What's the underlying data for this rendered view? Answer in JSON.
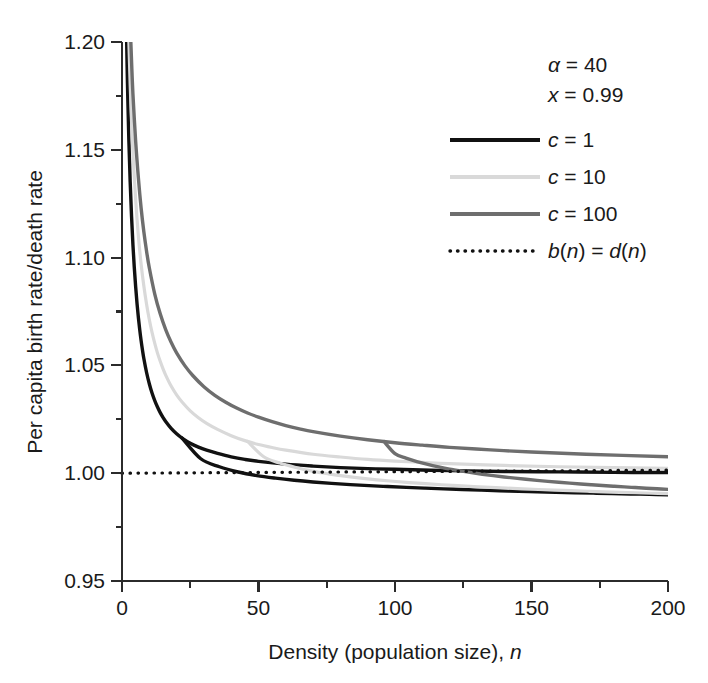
{
  "chart_data": {
    "type": "line",
    "title": "",
    "xlabel": "Density (population size), n",
    "ylabel": "Per capita birth rate/death rate",
    "xlim": [
      0,
      200
    ],
    "ylim": [
      0.95,
      1.2
    ],
    "grid": false,
    "legend_position": "top-right",
    "x_ticks": [
      0,
      50,
      100,
      150,
      200
    ],
    "x_tick_labels": [
      "0",
      "50",
      "100",
      "150",
      "200"
    ],
    "x_minor_ticks": [
      25,
      75,
      125,
      175
    ],
    "y_ticks": [
      0.95,
      1.0,
      1.05,
      1.1,
      1.15,
      1.2
    ],
    "y_tick_labels": [
      "0.95",
      "1.00",
      "1.05",
      "1.10",
      "1.15",
      "1.20"
    ],
    "y_minor_ticks": [
      0.975,
      1.025,
      1.075,
      1.125,
      1.175
    ],
    "annotations": [
      {
        "name": "alpha-param",
        "text": "α = 40"
      },
      {
        "name": "x-param",
        "text": "x = 0.99"
      }
    ],
    "series": [
      {
        "name": "c = 1",
        "label": "c = 1",
        "color": "#111111",
        "width": 3.4,
        "style": "solid",
        "x": [
          0.4,
          0.8,
          1.2,
          1.6,
          2,
          2.5,
          3,
          3.5,
          4,
          4.5,
          5,
          5.5,
          6,
          6.5,
          7,
          7.5,
          8,
          9,
          10,
          11,
          12,
          13,
          14,
          15,
          16,
          18,
          20,
          22,
          25,
          28,
          31,
          35,
          40,
          45,
          50,
          60,
          70,
          80,
          90,
          100,
          120,
          140,
          160,
          180,
          200
        ],
        "y": [
          1.36,
          1.29,
          1.242,
          1.208,
          1.181,
          1.155,
          1.135,
          1.119,
          1.106,
          1.0955,
          1.0865,
          1.0788,
          1.0722,
          1.0665,
          1.0615,
          1.0571,
          1.0532,
          1.0467,
          1.0415,
          1.0372,
          1.0337,
          1.0307,
          1.0281,
          1.0259,
          1.024,
          1.0208,
          1.0183,
          1.0163,
          1.0139,
          1.0121,
          1.0107,
          1.0092,
          1.0076,
          1.0064,
          1.0055,
          1.0042,
          1.0033,
          1.0026,
          1.0021,
          1.0018,
          1.0012,
          1.0008,
          1.0006,
          1.0004,
          1.0003
        ]
      },
      {
        "name": "c = 10",
        "label": "c = 10",
        "color": "#d9d9d9",
        "width": 3.2,
        "style": "solid",
        "x": [
          0.4,
          0.8,
          1.2,
          1.6,
          2,
          2.5,
          3,
          3.5,
          4,
          5,
          6,
          7,
          8,
          9,
          10,
          11,
          12,
          13,
          14,
          15,
          16,
          18,
          20,
          22,
          25,
          28,
          31,
          35,
          40,
          45,
          50,
          55,
          60,
          70,
          80,
          90,
          100,
          110,
          120,
          140,
          160,
          180,
          200
        ],
        "y": [
          1.4,
          1.335,
          1.289,
          1.255,
          1.228,
          1.201,
          1.18,
          1.163,
          1.149,
          1.127,
          1.11,
          1.097,
          1.0868,
          1.0784,
          1.0713,
          1.0653,
          1.0602,
          1.0557,
          1.0519,
          1.0485,
          1.0455,
          1.0404,
          1.0363,
          1.033,
          1.0289,
          1.0257,
          1.0231,
          1.0203,
          1.0174,
          1.0151,
          1.0133,
          1.0119,
          1.0107,
          1.0088,
          1.0075,
          1.0064,
          1.0056,
          1.005,
          1.0044,
          1.0036,
          1.003,
          1.0026,
          1.0023
        ]
      },
      {
        "name": "c = 100",
        "label": "c = 100",
        "color": "#6e6e6e",
        "width": 3.4,
        "style": "solid",
        "x": [
          0.4,
          0.8,
          1.2,
          1.6,
          2,
          2.5,
          3,
          3.5,
          4,
          5,
          6,
          7,
          8,
          9,
          10,
          12,
          14,
          16,
          18,
          20,
          23,
          26,
          30,
          34,
          38,
          42,
          46,
          50,
          55,
          60,
          65,
          70,
          80,
          90,
          100,
          110,
          120,
          135,
          150,
          170,
          200
        ],
        "y": [
          1.425,
          1.362,
          1.317,
          1.283,
          1.256,
          1.229,
          1.208,
          1.191,
          1.176,
          1.154,
          1.137,
          1.123,
          1.112,
          1.103,
          1.0953,
          1.0831,
          1.0739,
          1.0666,
          1.0607,
          1.0558,
          1.0499,
          1.0452,
          1.0401,
          1.0361,
          1.0329,
          1.0302,
          1.0279,
          1.026,
          1.0239,
          1.0221,
          1.0206,
          1.0193,
          1.0172,
          1.0155,
          1.0141,
          1.013,
          1.012,
          1.0108,
          1.0098,
          1.0088,
          1.0076
        ]
      }
    ],
    "reference_line": {
      "name": "b(n) = d(n)",
      "label": "b(n) = d(n)",
      "value": 1.0,
      "color": "#111111",
      "style": "dotted"
    },
    "asymptote_note": "curves approach ~0.990 at large n"
  },
  "legend": {
    "entries": [
      {
        "label": "c = 1",
        "swatch": "solid-black-line"
      },
      {
        "label": "c = 10",
        "swatch": "solid-lightgray-line"
      },
      {
        "label": "c = 100",
        "swatch": "solid-gray-line"
      },
      {
        "label": "b(n) = d(n)",
        "swatch": "dotted-black-line"
      }
    ]
  },
  "axes": {
    "x_title": "Density (population size), n",
    "y_title": "Per capita birth rate/death rate"
  }
}
